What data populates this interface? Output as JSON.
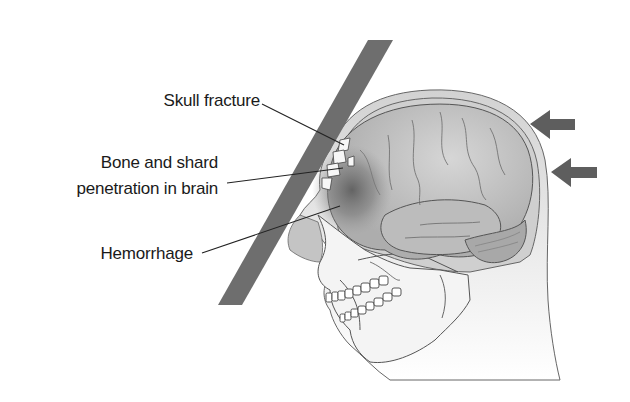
{
  "figure": {
    "type": "medical-illustration",
    "colors": {
      "background": "#ffffff",
      "impact_bar": "#6e6e6e",
      "arrows": "#5e5e5e",
      "skin": "#c9c9c9",
      "skin_light": "#e6e6e6",
      "brain": "#b5b5b5",
      "brain_highlight": "#d8d8d8",
      "hemorrhage": "#6a6a6a",
      "skull": "#f2f2f2",
      "outline": "#555555",
      "text": "#1a1a1a",
      "leader_line": "#222222"
    }
  },
  "labels": {
    "skull_fracture": "Skull fracture",
    "bone_shard_line1": "Bone and shard",
    "bone_shard_line2": "penetration in brain",
    "hemorrhage": "Hemorrhage"
  },
  "icons": {
    "force_arrow_top": "left-arrow",
    "force_arrow_bottom": "left-arrow"
  }
}
